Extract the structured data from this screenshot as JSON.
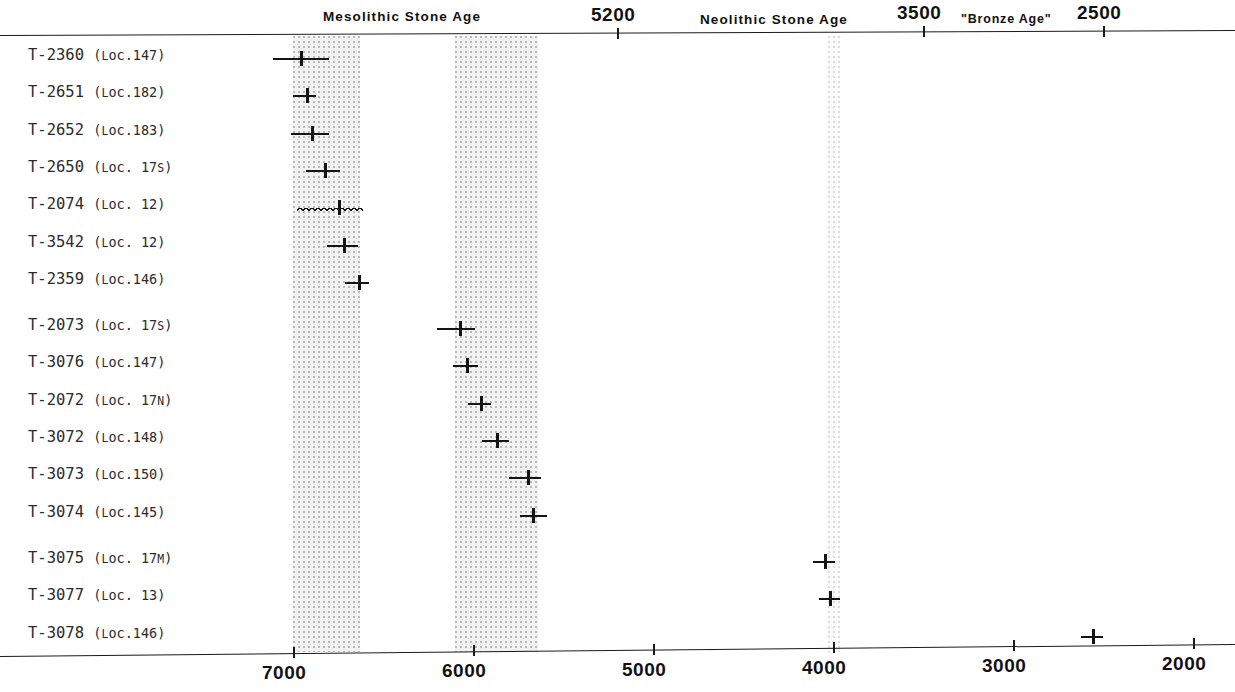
{
  "figure": {
    "clipped_top_line_left": "a",
    "clipped_top_line_right": "(y = ... , calibrated)"
  },
  "axis": {
    "top": {
      "ticks": [
        {
          "label": "5200",
          "value": 5200
        },
        {
          "label": "3500",
          "value": 3500
        },
        {
          "label": "2500",
          "value": 2500
        }
      ],
      "era_labels": [
        {
          "label": "Mesolithic  Stone Age",
          "center": 6400
        },
        {
          "label": "Neolithic  Stone Age",
          "center": 4350
        },
        {
          "label": "\"Bronze Age\"",
          "center": 3000
        }
      ]
    },
    "bottom": {
      "ticks": [
        {
          "label": "7000",
          "value": 7000
        },
        {
          "label": "6000",
          "value": 6000
        },
        {
          "label": "5000",
          "value": 5000
        },
        {
          "label": "4000",
          "value": 4000
        },
        {
          "label": "3000",
          "value": 3000
        },
        {
          "label": "2000",
          "value": 2000
        }
      ]
    },
    "range": [
      7250,
      1950
    ],
    "units": "BP"
  },
  "bands": [
    {
      "name": "band-mesolithic-early",
      "from": 7000,
      "to": 6630,
      "shade": "normal"
    },
    {
      "name": "band-mesolithic-late",
      "from": 6100,
      "to": 5640,
      "shade": "normal"
    },
    {
      "name": "band-neolithic-4000",
      "from": 4030,
      "to": 3960,
      "shade": "faint"
    }
  ],
  "chart_data": {
    "type": "scatter",
    "title": "",
    "xlabel": "",
    "ylabel": "",
    "xlim": [
      7250,
      1950
    ],
    "grid": false,
    "legend": null,
    "orientation": "horizontal-error-bars",
    "categories": [
      "T-2360 (Loc.147)",
      "T-2651 (Loc.182)",
      "T-2652 (Loc.183)",
      "T-2650 (Loc.17s)",
      "T-2074 (Loc. 12)",
      "T-3542 (Loc. 12)",
      "T-2359 (Loc.146)",
      "T-2073 (Loc.17s)",
      "T-3076 (Loc.147)",
      "T-2072 (Loc.17n)",
      "T-3072 (Loc.148)",
      "T-3073 (Loc.150)",
      "T-3074 (Loc.145)",
      "T-3075 (Loc.17m)",
      "T-3077 (Loc. 13)",
      "T-3078 (Loc.146)"
    ],
    "points": [
      {
        "lab_code": "T-2360",
        "locality": "147",
        "loc_sub": "",
        "value": 6960,
        "low": 7110,
        "high": 6800,
        "style": "plain"
      },
      {
        "lab_code": "T-2651",
        "locality": "182",
        "loc_sub": "",
        "value": 6930,
        "low": 7000,
        "high": 6870,
        "style": "plain"
      },
      {
        "lab_code": "T-2652",
        "locality": "183",
        "loc_sub": "",
        "value": 6900,
        "low": 7010,
        "high": 6800,
        "style": "plain"
      },
      {
        "lab_code": "T-2650",
        "locality": "17",
        "loc_sub": "s",
        "value": 6830,
        "low": 6930,
        "high": 6740,
        "style": "plain"
      },
      {
        "lab_code": "T-2074",
        "locality": "12",
        "loc_sub": "",
        "value": 6750,
        "low": 6980,
        "high": 6610,
        "style": "wavy"
      },
      {
        "lab_code": "T-3542",
        "locality": "12",
        "loc_sub": "",
        "value": 6720,
        "low": 6810,
        "high": 6640,
        "style": "plain"
      },
      {
        "lab_code": "T-2359",
        "locality": "146",
        "loc_sub": "",
        "value": 6640,
        "low": 6710,
        "high": 6580,
        "style": "plain"
      },
      {
        "lab_code": "T-2073",
        "locality": "17",
        "loc_sub": "s",
        "value": 6080,
        "low": 6200,
        "high": 5990,
        "style": "plain"
      },
      {
        "lab_code": "T-3076",
        "locality": "147",
        "loc_sub": "",
        "value": 6040,
        "low": 6110,
        "high": 5970,
        "style": "plain"
      },
      {
        "lab_code": "T-2072",
        "locality": "17",
        "loc_sub": "n",
        "value": 5960,
        "low": 6030,
        "high": 5900,
        "style": "plain"
      },
      {
        "lab_code": "T-3072",
        "locality": "148",
        "loc_sub": "",
        "value": 5870,
        "low": 5950,
        "high": 5800,
        "style": "plain"
      },
      {
        "lab_code": "T-3073",
        "locality": "150",
        "loc_sub": "",
        "value": 5700,
        "low": 5800,
        "high": 5620,
        "style": "plain"
      },
      {
        "lab_code": "T-3074",
        "locality": "145",
        "loc_sub": "",
        "value": 5670,
        "low": 5740,
        "high": 5590,
        "style": "plain"
      },
      {
        "lab_code": "T-3075",
        "locality": "17",
        "loc_sub": "m",
        "value": 4050,
        "low": 4110,
        "high": 3990,
        "style": "plain"
      },
      {
        "lab_code": "T-3077",
        "locality": "13",
        "loc_sub": "",
        "value": 4020,
        "low": 4080,
        "high": 3960,
        "style": "plain"
      },
      {
        "lab_code": "T-3078",
        "locality": "146",
        "loc_sub": "",
        "value": 2560,
        "low": 2620,
        "high": 2500,
        "style": "plain"
      }
    ]
  },
  "colors": {
    "ink": "#141414",
    "band": "#f2f2f2",
    "band_dot": "#b9b9b9",
    "label": "#2b2b2b"
  }
}
